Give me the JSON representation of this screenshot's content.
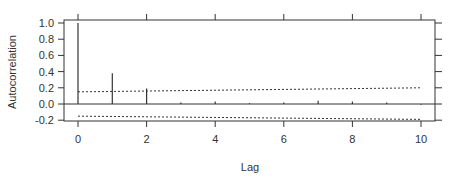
{
  "chart_data": {
    "type": "bar",
    "subtype": "acf-spike",
    "title": "",
    "xlabel": "Lag",
    "ylabel": "Autocorrelation",
    "x": [
      0,
      1,
      2,
      3,
      4,
      5,
      6,
      7,
      8,
      9,
      10
    ],
    "values": [
      1.0,
      0.38,
      0.19,
      0.02,
      0.03,
      0.01,
      0.02,
      0.04,
      0.03,
      0.02,
      -0.01
    ],
    "xlim": [
      -0.3,
      10.3
    ],
    "ylim": [
      -0.22,
      1.05
    ],
    "x_ticks": [
      0,
      2,
      4,
      6,
      8,
      10
    ],
    "x_tick_labels": [
      "0",
      "2",
      "4",
      "6",
      "8",
      "10"
    ],
    "y_ticks": [
      -0.2,
      0.0,
      0.2,
      0.4,
      0.6,
      0.8,
      1.0
    ],
    "y_tick_labels": [
      "-0.2",
      "0.0",
      "0.2",
      "0.4",
      "0.6",
      "0.8",
      "1.0"
    ],
    "confidence_bands": {
      "upper": {
        "x": [
          0,
          10
        ],
        "y": [
          0.15,
          0.2
        ]
      },
      "lower": {
        "x": [
          0,
          10
        ],
        "y": [
          -0.15,
          -0.19
        ]
      },
      "style": "dotted"
    },
    "zero_line": true,
    "grid": false,
    "legend": null,
    "colors": {
      "spike": "#333333",
      "axis": "#333333",
      "band": "#333333"
    }
  }
}
